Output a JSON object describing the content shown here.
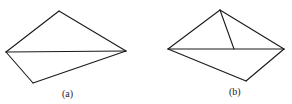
{
  "figures": [
    {
      "id": "a",
      "label": "(a)",
      "description": "Quadrilateral split by one diagonal into two triangles"
    },
    {
      "id": "b",
      "label": "(b)",
      "description": "Quadrilateral split by one diagonal, with an extra segment from the top vertex to a point on the diagonal"
    }
  ],
  "colors": {
    "stroke": "#1a1a1a",
    "background": "#ffffff"
  }
}
